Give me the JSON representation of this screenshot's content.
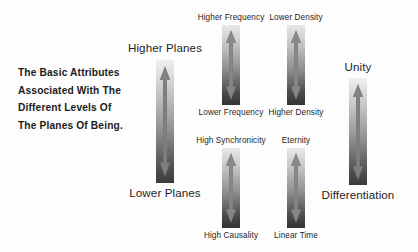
{
  "diagram": {
    "title_block": {
      "lines": [
        "The Basic Attributes",
        "Associated With The",
        "Different Levels Of",
        "The Planes Of Being."
      ]
    },
    "background_color": "#fdfdfd",
    "text_color": "#1e1e1e",
    "arrow_gradient": {
      "top_color": "#e8e8e8",
      "bottom_color": "#333333"
    },
    "axes": [
      {
        "id": "planes",
        "top_label": "Higher Planes",
        "bottom_label": "Lower Planes",
        "label_size": "large",
        "arrow_style": "double-headed",
        "center_x": 165,
        "bar_top": 60,
        "bar_bottom": 183,
        "bar_width": 18
      },
      {
        "id": "frequency",
        "top_label": "Higher Frequency",
        "bottom_label": "Lower Frequency",
        "label_size": "small",
        "arrow_style": "double-headed",
        "center_x": 231,
        "bar_top": 25,
        "bar_bottom": 105,
        "bar_width": 18
      },
      {
        "id": "density",
        "top_label": "Lower Density",
        "bottom_label": "Higher Density",
        "label_size": "small",
        "arrow_style": "double-headed",
        "center_x": 296,
        "bar_top": 25,
        "bar_bottom": 105,
        "bar_width": 18
      },
      {
        "id": "unity",
        "top_label": "Unity",
        "bottom_label": "Differentiation",
        "label_size": "large",
        "arrow_style": "double-headed",
        "center_x": 358,
        "bar_top": 78,
        "bar_bottom": 185,
        "bar_width": 18
      },
      {
        "id": "synchronicity",
        "top_label": "High Synchronicity",
        "bottom_label": "High Causality",
        "label_size": "small",
        "arrow_style": "double-headed",
        "center_x": 231,
        "bar_top": 148,
        "bar_bottom": 228,
        "bar_width": 18
      },
      {
        "id": "time",
        "top_label": "Eternity",
        "bottom_label": "Linear Time",
        "label_size": "small",
        "arrow_style": "double-headed",
        "center_x": 296,
        "bar_top": 148,
        "bar_bottom": 228,
        "bar_width": 18
      }
    ]
  }
}
